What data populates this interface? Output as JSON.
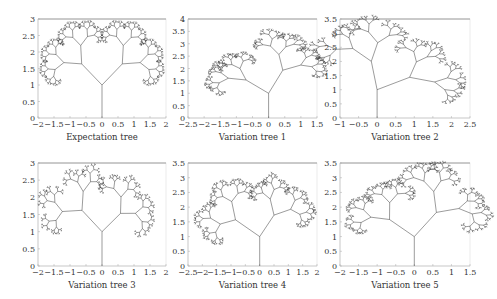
{
  "figure": {
    "panels": [
      {
        "id": "p1",
        "title": "Expectation tree",
        "xlim": [
          -2,
          2
        ],
        "ylim": [
          0,
          3
        ],
        "xticks": [
          "−2",
          "−1.5",
          "−1",
          "−0.5",
          "0",
          "0.5",
          "1",
          "1.5",
          "2"
        ],
        "xtick_vals": [
          -2,
          -1.5,
          -1,
          -0.5,
          0,
          0.5,
          1,
          1.5,
          2
        ],
        "yticks": [
          "0",
          "0.5",
          "1",
          "1.5",
          "2",
          "2.5",
          "3"
        ],
        "ytick_vals": [
          0,
          0.5,
          1,
          1.5,
          2,
          2.5,
          3
        ],
        "box": {
          "x": 38,
          "y": 19,
          "w": 128,
          "h": 99
        },
        "lean": 0,
        "spread": 1.0,
        "depth": 9,
        "trunk": 1.0
      },
      {
        "id": "p2",
        "title": "Variation tree 1",
        "xlim": [
          -2.5,
          1.5
        ],
        "ylim": [
          0,
          4
        ],
        "xticks": [
          "−2.5",
          "−2",
          "−1.5",
          "−1",
          "−0.5",
          "0",
          "0.5",
          "1",
          "1.5"
        ],
        "xtick_vals": [
          -2.5,
          -2,
          -1.5,
          -1,
          -0.5,
          0,
          0.5,
          1,
          1.5
        ],
        "yticks": [
          "0",
          "0.5",
          "1",
          "1.5",
          "2",
          "2.5",
          "3",
          "3.5",
          "4"
        ],
        "ytick_vals": [
          0,
          0.5,
          1,
          1.5,
          2,
          2.5,
          3,
          3.5,
          4
        ],
        "box": {
          "x": 188,
          "y": 19,
          "w": 129,
          "h": 99
        },
        "lean": -0.35,
        "spread": 0.9,
        "depth": 9,
        "trunk": 1.0
      },
      {
        "id": "p3",
        "title": "Variation tree 2",
        "xlim": [
          -1,
          2.5
        ],
        "ylim": [
          0,
          3.5
        ],
        "xticks": [
          "−1",
          "−0.5",
          "0",
          "0.5",
          "1",
          "1.5",
          "2",
          "2.5"
        ],
        "xtick_vals": [
          -1,
          -0.5,
          0,
          0.5,
          1,
          1.5,
          2,
          2.5
        ],
        "yticks": [
          "0",
          "0.5",
          "1",
          "1.5",
          "2",
          "2.5",
          "3",
          "3.5"
        ],
        "ytick_vals": [
          0,
          0.5,
          1,
          1.5,
          2,
          2.5,
          3,
          3.5
        ],
        "box": {
          "x": 340,
          "y": 19,
          "w": 130,
          "h": 99
        },
        "lean": 0.45,
        "spread": 0.85,
        "depth": 8,
        "trunk": 1.0
      },
      {
        "id": "p4",
        "title": "Variation tree 3",
        "xlim": [
          -2,
          2
        ],
        "ylim": [
          0,
          3
        ],
        "xticks": [
          "−2",
          "−1.5",
          "−1",
          "−0.5",
          "0",
          "0.5",
          "1",
          "1.5",
          "2"
        ],
        "xtick_vals": [
          -2,
          -1.5,
          -1,
          -0.5,
          0,
          0.5,
          1,
          1.5,
          2
        ],
        "yticks": [
          "0",
          "0.5",
          "1",
          "1.5",
          "2",
          "2.5",
          "3"
        ],
        "ytick_vals": [
          0,
          0.5,
          1,
          1.5,
          2,
          2.5,
          3
        ],
        "box": {
          "x": 38,
          "y": 163,
          "w": 128,
          "h": 103
        },
        "lean": 0.05,
        "spread": 1.05,
        "depth": 8,
        "trunk": 1.0
      },
      {
        "id": "p5",
        "title": "Variation tree 4",
        "xlim": [
          -2.5,
          2
        ],
        "ylim": [
          0,
          3.5
        ],
        "xticks": [
          "−2.5",
          "−2",
          "−1.5",
          "−1",
          "−0.5",
          "0",
          "0.5",
          "1",
          "1.5",
          "2"
        ],
        "xtick_vals": [
          -2.5,
          -2,
          -1.5,
          -1,
          -0.5,
          0,
          0.5,
          1,
          1.5,
          2
        ],
        "yticks": [
          "0",
          "0.5",
          "1",
          "1.5",
          "2",
          "2.5",
          "3",
          "3.5"
        ],
        "ytick_vals": [
          0,
          0.5,
          1,
          1.5,
          2,
          2.5,
          3,
          3.5
        ],
        "box": {
          "x": 188,
          "y": 163,
          "w": 129,
          "h": 103
        },
        "lean": -0.1,
        "spread": 1.0,
        "depth": 9,
        "trunk": 1.0
      },
      {
        "id": "p6",
        "title": "Variation tree 5",
        "xlim": [
          -2,
          1.5
        ],
        "ylim": [
          0,
          3.5
        ],
        "xticks": [
          "−2",
          "−1.5",
          "−1",
          "−0.5",
          "0",
          "0.5",
          "1",
          "1.5"
        ],
        "xtick_vals": [
          -2,
          -1.5,
          -1,
          -0.5,
          0,
          0.5,
          1,
          1.5
        ],
        "yticks": [
          "0",
          "0.5",
          "1",
          "1.5",
          "2",
          "2.5",
          "3",
          "3.5"
        ],
        "ytick_vals": [
          0,
          0.5,
          1,
          1.5,
          2,
          2.5,
          3,
          3.5
        ],
        "box": {
          "x": 340,
          "y": 163,
          "w": 130,
          "h": 103
        },
        "lean": -0.25,
        "spread": 1.0,
        "depth": 9,
        "trunk": 1.0
      }
    ]
  },
  "chart_data": [
    {
      "type": "line",
      "title": "Expectation tree",
      "xlabel": "Expectation tree",
      "ylabel": "",
      "xlim": [
        -2,
        2
      ],
      "ylim": [
        0,
        3
      ],
      "grid": false,
      "description": "Symmetric fractal binary tree, trunk from (0,0) to (0,1), crown spanning x≈-1.9..1.9, top ≈2.95"
    },
    {
      "type": "line",
      "title": "Variation tree 1",
      "xlabel": "Variation tree 1",
      "ylabel": "",
      "xlim": [
        -2.5,
        1.5
      ],
      "ylim": [
        0,
        4
      ],
      "grid": false,
      "description": "Fractal tree leaning left, crown x≈-1.9..1.1, top ≈3.5"
    },
    {
      "type": "line",
      "title": "Variation tree 2",
      "xlabel": "Variation tree 2",
      "ylabel": "",
      "xlim": [
        -1,
        2.5
      ],
      "ylim": [
        0,
        3.5
      ],
      "grid": false,
      "description": "Fractal tree leaning right, crown x≈-0.8..2.1, top ≈3.1"
    },
    {
      "type": "line",
      "title": "Variation tree 3",
      "xlabel": "Variation tree 3",
      "ylabel": "",
      "xlim": [
        -2,
        2
      ],
      "ylim": [
        0,
        3
      ],
      "grid": false,
      "description": "Sparse fractal tree, crown x≈-1.7..1.8, top ≈2.8"
    },
    {
      "type": "line",
      "title": "Variation tree 4",
      "xlabel": "Variation tree 4",
      "ylabel": "",
      "xlim": [
        -2.5,
        2
      ],
      "ylim": [
        0,
        3.5
      ],
      "grid": false,
      "description": "Dense fractal tree, crown x≈-1.9..1.6, top ≈3.1"
    },
    {
      "type": "line",
      "title": "Variation tree 5",
      "xlabel": "Variation tree 5",
      "ylabel": "",
      "xlim": [
        -2,
        1.5
      ],
      "ylim": [
        0,
        3.5
      ],
      "grid": false,
      "description": "Fractal tree with wide left branch, crown x≈-1.9..1.2, top ≈3.1"
    }
  ]
}
